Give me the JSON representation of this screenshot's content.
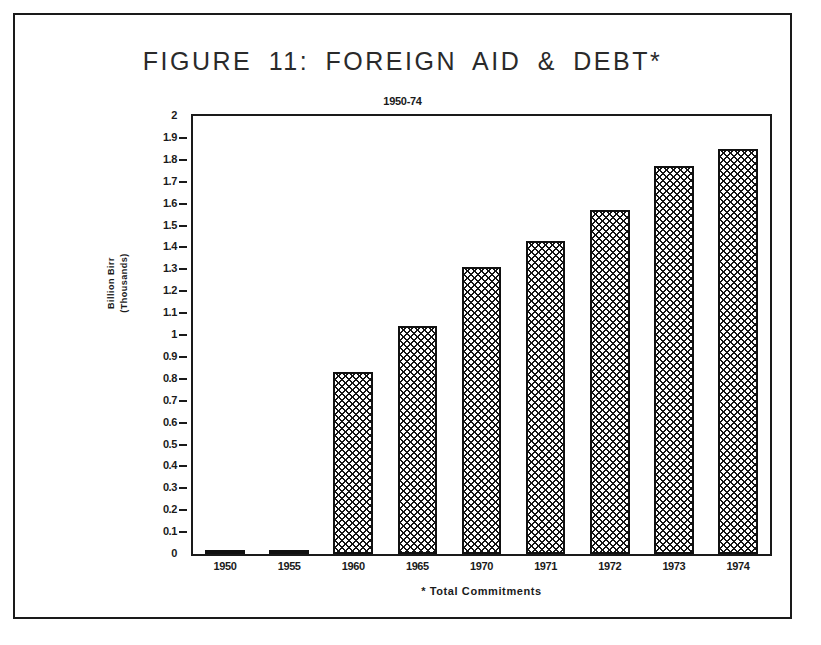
{
  "figure": {
    "title": "FIGURE 11:  FOREIGN AID  &  DEBT*",
    "subtitle": "1950-74",
    "footnote": "* Total Commitments"
  },
  "axes": {
    "y_title_line1": "Billion Birr",
    "y_title_line2": "(Thousands)"
  },
  "chart_data": {
    "type": "bar",
    "title": "FIGURE 11:  FOREIGN AID  &  DEBT*",
    "subtitle": "1950-74",
    "xlabel": "* Total Commitments",
    "ylabel": "Billion Birr (Thousands)",
    "ylim": [
      0,
      2
    ],
    "ytick_step": 0.1,
    "grid": false,
    "legend": false,
    "categories": [
      "1950",
      "1955",
      "1960",
      "1965",
      "1970",
      "1971",
      "1972",
      "1973",
      "1974"
    ],
    "values": [
      0.01,
      0.02,
      0.83,
      1.04,
      1.31,
      1.43,
      1.57,
      1.77,
      1.85
    ],
    "ytick_labels": [
      "2",
      "1.9",
      "1.8",
      "1.7",
      "1.6",
      "1.5",
      "1.4",
      "1.3",
      "1.2",
      "1.1",
      "1",
      "0.9",
      "0.8",
      "0.7",
      "0.6",
      "0.5",
      "0.4",
      "0.3",
      "0.2",
      "0.1",
      "0"
    ],
    "ytick_values": [
      2,
      1.9,
      1.8,
      1.7,
      1.6,
      1.5,
      1.4,
      1.3,
      1.2,
      1.1,
      1,
      0.9,
      0.8,
      0.7,
      0.6,
      0.5,
      0.4,
      0.3,
      0.2,
      0.1,
      0
    ],
    "series": [
      {
        "name": "Total Commitments",
        "values": [
          0.01,
          0.02,
          0.83,
          1.04,
          1.31,
          1.43,
          1.57,
          1.77,
          1.85
        ]
      }
    ],
    "colors": {
      "bar_fill": "#141414",
      "bar_outline": "#111111",
      "background": "#ffffff",
      "axis": "#1a1a1a"
    }
  }
}
